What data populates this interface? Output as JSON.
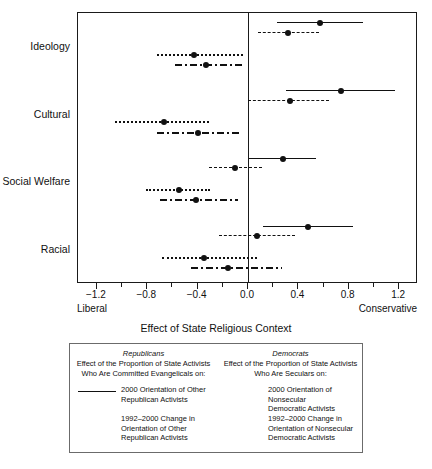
{
  "chart_data": {
    "type": "scatter",
    "title": "",
    "xlabel": "Effect of State Religious Context",
    "ylabel": "",
    "xlim": [
      -1.35,
      1.35
    ],
    "grid": false,
    "x_ticks": [
      -1.2,
      -1.0,
      -0.8,
      -0.6,
      -0.4,
      -0.2,
      0.0,
      0.2,
      0.4,
      0.6,
      0.8,
      1.0,
      1.2
    ],
    "x_tick_labels": [
      "-1.2",
      "",
      "-0.8",
      "",
      "-0.4",
      "",
      "0.0",
      "",
      "0.4",
      "",
      "0.8",
      "",
      "1.2"
    ],
    "x_end_labels": {
      "left": "Liberal",
      "right": "Conservative"
    },
    "categories": [
      "Ideology",
      "Cultural",
      "Social Welfare",
      "Racial"
    ],
    "zero_reference_line": 0.0,
    "series": [
      {
        "name": "2000 Orientation of Other Republican Activists",
        "style": "solid",
        "group": "Republicans",
        "points": [
          {
            "category": "Ideology",
            "estimate": 0.57,
            "low": 0.23,
            "high": 0.91
          },
          {
            "category": "Cultural",
            "estimate": 0.74,
            "low": 0.3,
            "high": 1.17
          },
          {
            "category": "Social Welfare",
            "estimate": 0.28,
            "low": 0.01,
            "high": 0.54
          },
          {
            "category": "Racial",
            "estimate": 0.48,
            "low": 0.12,
            "high": 0.83
          }
        ]
      },
      {
        "name": "1992-2000 Change in Orientation of Other Republican Activists",
        "style": "dashed",
        "group": "Republicans",
        "points": [
          {
            "category": "Ideology",
            "estimate": 0.32,
            "low": 0.08,
            "high": 0.56
          },
          {
            "category": "Cultural",
            "estimate": 0.33,
            "low": 0.0,
            "high": 0.64
          },
          {
            "category": "Social Welfare",
            "estimate": -0.1,
            "low": -0.31,
            "high": 0.11
          },
          {
            "category": "Racial",
            "estimate": 0.07,
            "low": -0.23,
            "high": 0.37
          }
        ]
      },
      {
        "name": "2000 Orientation of Nonsecular Democratic Activists",
        "style": "dotted",
        "group": "Democrats",
        "points": [
          {
            "category": "Ideology",
            "estimate": -0.43,
            "low": -0.72,
            "high": -0.04
          },
          {
            "category": "Cultural",
            "estimate": -0.67,
            "low": -1.06,
            "high": -0.31
          },
          {
            "category": "Social Welfare",
            "estimate": -0.55,
            "low": -0.81,
            "high": -0.3
          },
          {
            "category": "Racial",
            "estimate": -0.35,
            "low": -0.68,
            "high": 0.07
          }
        ]
      },
      {
        "name": "1992-2000 Change in Orientation of Nonsecular Democratic Activists",
        "style": "dashdot",
        "group": "Democrats",
        "points": [
          {
            "category": "Ideology",
            "estimate": -0.33,
            "low": -0.58,
            "high": -0.05
          },
          {
            "category": "Cultural",
            "estimate": -0.4,
            "low": -0.72,
            "high": -0.07
          },
          {
            "category": "Social Welfare",
            "estimate": -0.41,
            "low": -0.7,
            "high": -0.08
          },
          {
            "category": "Racial",
            "estimate": -0.16,
            "low": -0.45,
            "high": 0.27
          }
        ]
      }
    ]
  },
  "legend": {
    "columns": [
      {
        "title": "Republicans",
        "subtitle_line1": "Effect of the Proportion of State Activists",
        "subtitle_line2": "Who Are Committed Evangelicals on:",
        "entries": [
          {
            "style": "solid",
            "line1": "2000 Orientation of Other",
            "line2": "Republican Activists",
            "line3": ""
          },
          {
            "style": "dashed",
            "line1": "1992–2000 Change in",
            "line2": "Orientation of Other",
            "line3": "Republican Activists"
          }
        ]
      },
      {
        "title": "Democrats",
        "subtitle_line1": "Effect of the Proportion of State Activists",
        "subtitle_line2": "Who Are Seculars on:",
        "entries": [
          {
            "style": "dotted",
            "line1": "2000 Orientation of Nonsecular",
            "line2": "Democratic Activists",
            "line3": ""
          },
          {
            "style": "dashdot",
            "line1": "1992–2000 Change in",
            "line2": "Orientation of Nonsecular",
            "line3": "Democratic Activists"
          }
        ]
      }
    ]
  },
  "colors": {
    "ink": "#111111",
    "frame": "#1a1a1a",
    "legend_border": "#6b6b6b",
    "background": "#ffffff"
  }
}
